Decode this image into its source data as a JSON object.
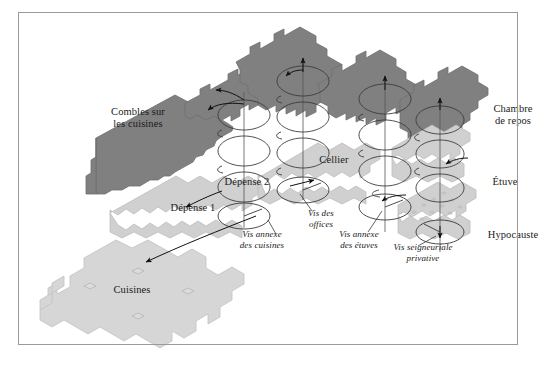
{
  "figure": {
    "kind": "exploded-axonometric-architectural-diagram",
    "border_color": "#9a9a9a",
    "background_color": "#ffffff"
  },
  "palette": {
    "upper_floor_fill": "#808080",
    "upper_floor_stroke": "#6f6f6f",
    "mid_floor_fill": "#d0d0d0",
    "mid_floor_stroke": "#bdbdbd",
    "lower_floor_fill": "#d6d6d6",
    "lower_floor_stroke": "#c2c2c2",
    "hypocaust_pillar_fill": "#c2c2c2",
    "stair_stroke": "#3a3a3a",
    "axis_stroke": "#555555",
    "arrow_stroke": "#111111",
    "leader_stroke": "#3a3a3a",
    "text_color": "#1a1a1a"
  },
  "labels": {
    "rooms": [
      {
        "id": "combles",
        "text": "Combles sur\nles cuisines",
        "x": 138,
        "y": 118,
        "align": "center"
      },
      {
        "id": "depense2",
        "text": "Dépense 2",
        "x": 247,
        "y": 182,
        "align": "center"
      },
      {
        "id": "cellier",
        "text": "Cellier",
        "x": 334,
        "y": 160,
        "align": "center"
      },
      {
        "id": "depense1",
        "text": "Dépense 1",
        "x": 193,
        "y": 208,
        "align": "center"
      },
      {
        "id": "chambre",
        "text": "Chambre\nde repos",
        "x": 513,
        "y": 115,
        "align": "center"
      },
      {
        "id": "etuve",
        "text": "Étuve",
        "x": 505,
        "y": 182,
        "align": "center"
      },
      {
        "id": "hypocauste",
        "text": "Hypocauste",
        "x": 513,
        "y": 235,
        "align": "center"
      },
      {
        "id": "cuisines",
        "text": "Cuisines",
        "x": 132,
        "y": 290,
        "align": "center"
      }
    ],
    "stairs": [
      {
        "id": "vis-annexe-cuisines",
        "text": "Vis annexe\ndes cuisines",
        "x": 262,
        "y": 240,
        "align": "center"
      },
      {
        "id": "vis-des-offices",
        "text": "Vis des\noffices",
        "x": 321,
        "y": 219,
        "align": "center"
      },
      {
        "id": "vis-annexe-etuves",
        "text": "Vis annexe\ndes étuves",
        "x": 359,
        "y": 240,
        "align": "center"
      },
      {
        "id": "vis-seigneuriale",
        "text": "Vis seigneuriale\nprivative",
        "x": 423,
        "y": 253,
        "align": "center"
      }
    ]
  },
  "levels": [
    {
      "id": "combles-sur-les-cuisines",
      "tone": "upper",
      "label_ref": "combles"
    },
    {
      "id": "depense-2",
      "tone": "upper",
      "label_ref": "depense2"
    },
    {
      "id": "cellier-upper",
      "tone": "upper",
      "label_ref": null
    },
    {
      "id": "chambre-de-repos",
      "tone": "upper",
      "label_ref": "chambre"
    },
    {
      "id": "depense-1",
      "tone": "mid",
      "label_ref": "depense1"
    },
    {
      "id": "cellier",
      "tone": "mid",
      "label_ref": "cellier"
    },
    {
      "id": "etuve",
      "tone": "mid",
      "label_ref": "etuve"
    },
    {
      "id": "hypocauste",
      "tone": "mid",
      "label_ref": "hypocauste"
    },
    {
      "id": "cuisines",
      "tone": "lower",
      "label_ref": "cuisines"
    }
  ],
  "staircases": [
    {
      "id": "vis-annexe-des-cuisines",
      "axis_x": 244,
      "top_y": 94,
      "bottom_y": 228,
      "rx": 26,
      "turns": 3,
      "label_ref": "vis-annexe-cuisines"
    },
    {
      "id": "vis-des-offices",
      "axis_x": 303,
      "top_y": 60,
      "bottom_y": 200,
      "rx": 26,
      "turns": 3,
      "label_ref": "vis-des-offices"
    },
    {
      "id": "vis-annexe-des-etuves",
      "axis_x": 385,
      "top_y": 78,
      "bottom_y": 232,
      "rx": 26,
      "turns": 3,
      "label_ref": "vis-annexe-etuves"
    },
    {
      "id": "vis-seigneuriale-privative",
      "axis_x": 440,
      "top_y": 100,
      "bottom_y": 252,
      "rx": 24,
      "turns": 3,
      "label_ref": "vis-seigneuriale"
    }
  ]
}
